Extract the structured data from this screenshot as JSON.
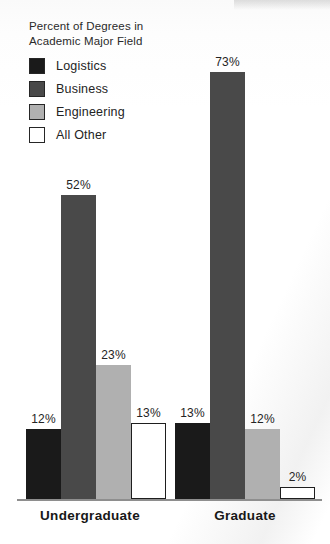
{
  "chart_data": {
    "type": "bar",
    "title": "Percent of Degrees in\nAcademic Major Field",
    "title_line1": "Percent of Degrees in",
    "title_line2": "Academic Major Field",
    "xlabel": "",
    "ylabel": "",
    "ylim": [
      0,
      80
    ],
    "grid": false,
    "legend_position": "top-left",
    "value_suffix": "%",
    "categories": [
      "Undergraduate",
      "Graduate"
    ],
    "series": [
      {
        "name": "Logistics",
        "color": "#1a1a1a",
        "values": [
          12,
          13
        ],
        "labels": [
          "12%",
          "13%"
        ]
      },
      {
        "name": "Business",
        "color": "#494949",
        "values": [
          52,
          73
        ],
        "labels": [
          "52%",
          "73%"
        ]
      },
      {
        "name": "Engineering",
        "color": "#b0b0b0",
        "values": [
          23,
          12
        ],
        "labels": [
          "23%",
          "12%"
        ]
      },
      {
        "name": "All Other",
        "color": "#ffffff",
        "values": [
          13,
          2
        ],
        "labels": [
          "13%",
          "2%"
        ]
      }
    ]
  },
  "legend": {
    "items": [
      {
        "label": "Logistics",
        "color": "#1a1a1a"
      },
      {
        "label": "Business",
        "color": "#494949"
      },
      {
        "label": "Engineering",
        "color": "#b0b0b0"
      },
      {
        "label": "All Other",
        "color": "#ffffff"
      }
    ]
  },
  "axis": {
    "group_labels": [
      "Undergraduate",
      "Graduate"
    ]
  },
  "bars": [
    {
      "name": "bar-undergraduate-logistics",
      "value_label": "12%"
    },
    {
      "name": "bar-undergraduate-business",
      "value_label": "52%"
    },
    {
      "name": "bar-undergraduate-engineering",
      "value_label": "23%"
    },
    {
      "name": "bar-undergraduate-all-other",
      "value_label": "13%"
    },
    {
      "name": "bar-graduate-logistics",
      "value_label": "13%"
    },
    {
      "name": "bar-graduate-business",
      "value_label": "73%"
    },
    {
      "name": "bar-graduate-engineering",
      "value_label": "12%"
    },
    {
      "name": "bar-graduate-all-other",
      "value_label": "2%"
    }
  ]
}
